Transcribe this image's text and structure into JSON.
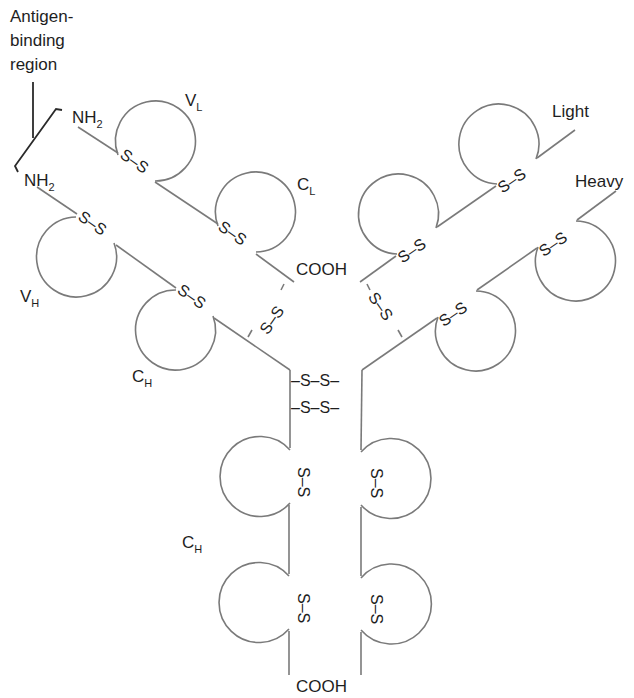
{
  "diagram": {
    "labels": {
      "antigen_binding_region": [
        "Antigen-",
        "binding",
        "region"
      ],
      "nh2": "NH",
      "nh2_sub": "2",
      "cooh": "COOH",
      "light": "Light",
      "heavy": "Heavy",
      "v_l": "V",
      "v_l_sub": "L",
      "c_l": "C",
      "c_l_sub": "L",
      "v_h": "V",
      "v_h_sub": "H",
      "c_h": "C",
      "c_h_sub": "H",
      "disulfide": "S–S",
      "interchain_disulfide": "–S–S–"
    },
    "chains": [
      {
        "name": "left light chain",
        "terminus_start": "NH2",
        "terminus_end": "COOH",
        "domains": [
          "VL",
          "CL"
        ]
      },
      {
        "name": "left heavy chain",
        "terminus_start": "NH2",
        "terminus_end": "COOH",
        "domains": [
          "VH",
          "CH",
          "CH",
          "CH"
        ]
      },
      {
        "name": "right light chain",
        "label": "Light",
        "domains": [
          "VL",
          "CL"
        ]
      },
      {
        "name": "right heavy chain",
        "label": "Heavy",
        "domains": [
          "VH",
          "CH",
          "CH",
          "CH"
        ]
      }
    ],
    "colors": {
      "line": "#7a7a7a",
      "text": "#1e1e1e",
      "background": "#ffffff"
    }
  }
}
